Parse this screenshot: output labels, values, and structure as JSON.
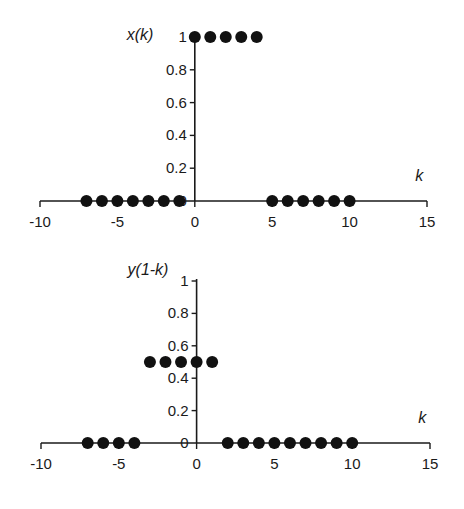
{
  "chart_data": [
    {
      "type": "scatter",
      "title": "",
      "ylabel": "x(k)",
      "xlabel": "k",
      "xlim": [
        -10,
        15
      ],
      "ylim": [
        0,
        1
      ],
      "x_ticks": [
        "-10",
        "-5",
        "0",
        "5",
        "10",
        "15"
      ],
      "y_ticks": [
        "0",
        "0.2",
        "0.4",
        "0.6",
        "0.8",
        "1"
      ],
      "grid": false,
      "series": [
        {
          "name": "x(k)",
          "x": [
            -7,
            -6,
            -5,
            -4,
            -3,
            -2,
            -1,
            0,
            1,
            2,
            3,
            4,
            5,
            6,
            7,
            8,
            9,
            10
          ],
          "values": [
            0,
            0,
            0,
            0,
            0,
            0,
            0,
            1,
            1,
            1,
            1,
            1,
            0,
            0,
            0,
            0,
            0,
            0
          ]
        }
      ]
    },
    {
      "type": "scatter",
      "title": "",
      "ylabel": "y(1-k)",
      "xlabel": "k",
      "xlim": [
        -10,
        15
      ],
      "ylim": [
        0,
        1
      ],
      "x_ticks": [
        "-10",
        "-5",
        "0",
        "5",
        "10",
        "15"
      ],
      "y_ticks": [
        "0",
        "0.2",
        "0.4",
        "0.6",
        "0.8",
        "1"
      ],
      "grid": false,
      "series": [
        {
          "name": "y(1-k)",
          "x": [
            -7,
            -6,
            -5,
            -4,
            -3,
            -2,
            -1,
            0,
            1,
            2,
            3,
            4,
            5,
            6,
            7,
            8,
            9,
            10
          ],
          "values": [
            0,
            0,
            0,
            0,
            0.5,
            0.5,
            0.5,
            0.5,
            0.5,
            0,
            0,
            0,
            0,
            0,
            0,
            0,
            0,
            0
          ]
        }
      ]
    }
  ],
  "charts": [
    {
      "ylabel": "x(k)",
      "xlabel": "k"
    },
    {
      "ylabel": "y(1-k)",
      "xlabel": "k"
    }
  ]
}
